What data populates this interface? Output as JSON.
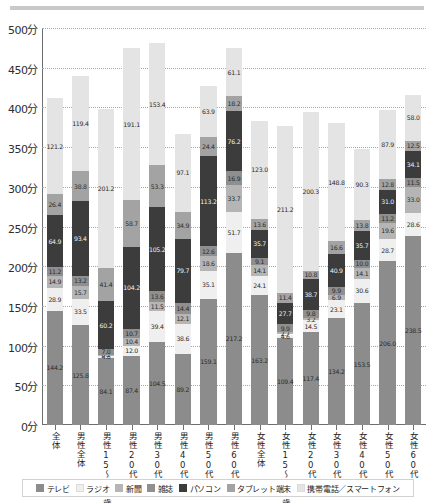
{
  "chart_data": {
    "type": "bar",
    "stacked": true,
    "title": "",
    "xlabel": "",
    "ylabel": "",
    "ylim": [
      0,
      500
    ],
    "ytick_labels": [
      "0分",
      "50分",
      "100分",
      "150分",
      "200分",
      "250分",
      "300分",
      "350分",
      "400分",
      "450分",
      "500分"
    ],
    "ytick_values": [
      0,
      50,
      100,
      150,
      200,
      250,
      300,
      350,
      400,
      450,
      500
    ],
    "grid": true,
    "legend_position": "bottom",
    "categories": [
      "全体",
      "男性全体",
      "男性15～19歳",
      "男性20代",
      "男性30代",
      "男性40代",
      "男性50代",
      "男性60代",
      "女性全体",
      "女性15～19歳",
      "女性20代",
      "女性30代",
      "女性40代",
      "女性50代",
      "女性60代"
    ],
    "series": [
      {
        "name": "テレビ",
        "color": "#8c8c8c",
        "values": [
          144.2,
          125.8,
          84.1,
          87.4,
          104.5,
          89.2,
          159.1,
          217.2,
          163.2,
          109.4,
          117.4,
          134.2,
          153.5,
          206.0,
          238.5
        ]
      },
      {
        "name": "ラジオ",
        "color": "#efefef",
        "values": [
          28.9,
          33.5,
          4.6,
          12.0,
          39.4,
          38.6,
          35.1,
          51.7,
          24.1,
          4.6,
          14.5,
          23.1,
          30.6,
          28.7,
          28.6
        ]
      },
      {
        "name": "新聞",
        "color": "#b5b5b5",
        "values": [
          14.9,
          15.7,
          0.1,
          10.4,
          11.5,
          12.1,
          18.6,
          33.7,
          14.1,
          2.7,
          3.2,
          6.9,
          14.1,
          19.6,
          33.0
        ]
      },
      {
        "name": "雑誌",
        "color": "#8f8f8f",
        "values": [
          11.2,
          13.2,
          7.0,
          10.7,
          13.6,
          14.4,
          12.6,
          16.9,
          9.1,
          9.9,
          9.8,
          9.9,
          10.0,
          11.2,
          11.5
        ]
      },
      {
        "name": "パソコン",
        "color": "#3c3c3c",
        "values": [
          64.9,
          93.4,
          60.2,
          104.2,
          105.2,
          79.7,
          113.2,
          76.2,
          35.7,
          27.7,
          38.7,
          40.9,
          35.7,
          31.0,
          34.1
        ]
      },
      {
        "name": "タブレット端末",
        "color": "#a3a3a3",
        "values": [
          26.4,
          38.8,
          41.4,
          58.7,
          53.3,
          34.9,
          24.4,
          18.2,
          13.6,
          11.4,
          10.8,
          16.6,
          13.8,
          12.8,
          12.5
        ]
      },
      {
        "name": "携帯電話／スマートフォン",
        "color": "#e4e4e4",
        "values": [
          121.2,
          119.4,
          201.2,
          191.1,
          153.4,
          97.1,
          63.9,
          61.1,
          123.0,
          211.2,
          200.3,
          148.8,
          90.3,
          87.9,
          58.0
        ]
      }
    ]
  },
  "legend": {
    "items": [
      {
        "label": "テレビ",
        "color": "#8c8c8c"
      },
      {
        "label": "ラジオ",
        "color": "#efefef"
      },
      {
        "label": "新聞",
        "color": "#b5b5b5"
      },
      {
        "label": "雑誌",
        "color": "#8f8f8f"
      },
      {
        "label": "パソコン",
        "color": "#3c3c3c"
      },
      {
        "label": "タブレット端末",
        "color": "#a3a3a3"
      },
      {
        "label": "携帯電話／スマートフォン",
        "color": "#e4e4e4"
      }
    ]
  }
}
